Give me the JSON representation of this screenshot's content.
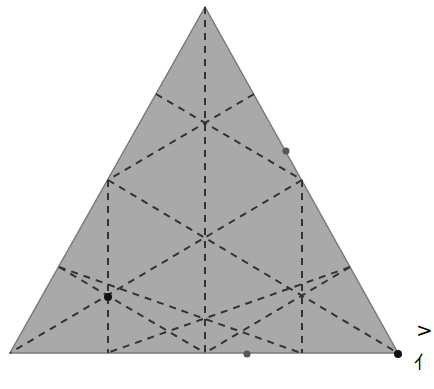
{
  "diagram": {
    "title": "",
    "triangle": {
      "vertices": [
        [
          205,
          7
        ],
        [
          10,
          353
        ],
        [
          398,
          353
        ]
      ],
      "fill": "#a9a9a9",
      "stroke": "#7a7a7a"
    },
    "grid_lines": [
      [
        [
          205,
          7
        ],
        [
          205,
          353
        ]
      ],
      [
        [
          108,
          180
        ],
        [
          108,
          353
        ]
      ],
      [
        [
          302,
          180
        ],
        [
          302,
          353
        ]
      ],
      [
        [
          156,
          94
        ],
        [
          302,
          180
        ]
      ],
      [
        [
          254,
          94
        ],
        [
          108,
          180
        ]
      ],
      [
        [
          108,
          180
        ],
        [
          398,
          353
        ]
      ],
      [
        [
          302,
          180
        ],
        [
          10,
          353
        ]
      ],
      [
        [
          59,
          267
        ],
        [
          301,
          353
        ]
      ],
      [
        [
          350,
          267
        ],
        [
          107,
          353
        ]
      ],
      [
        [
          59,
          267
        ],
        [
          205,
          353
        ]
      ],
      [
        [
          350,
          267
        ],
        [
          205,
          353
        ]
      ]
    ],
    "grid_style": {
      "color": "#333333",
      "dash": "7,6",
      "width": 2
    },
    "points": [
      {
        "name": "point-black-left",
        "x": 108,
        "y": 297,
        "r": 4,
        "color": "#111111"
      },
      {
        "name": "point-gray-right-edge",
        "x": 286,
        "y": 151,
        "r": 3.5,
        "color": "#555555"
      },
      {
        "name": "point-gray-bottom-edge",
        "x": 247,
        "y": 354,
        "r": 3.5,
        "color": "#555555"
      },
      {
        "name": "point-black-corner",
        "x": 398,
        "y": 354,
        "r": 4,
        "color": "#111111"
      }
    ],
    "marks": [
      {
        "name": "chevron-mark",
        "text": ">",
        "x": 416,
        "y": 338,
        "size": 20
      },
      {
        "name": "scribble-mark",
        "text": "⺅",
        "x": 414,
        "y": 366,
        "size": 18
      }
    ]
  }
}
